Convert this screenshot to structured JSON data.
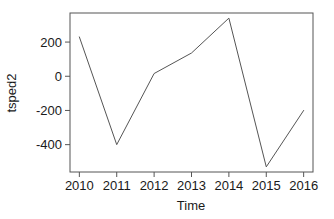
{
  "chart_data": {
    "type": "line",
    "title": "",
    "xlabel": "Time",
    "ylabel": "tsped2",
    "x": [
      2010,
      2011,
      2012,
      2013,
      2014,
      2015,
      2016
    ],
    "values": [
      230,
      -400,
      16,
      136,
      340,
      -530,
      -200
    ],
    "series": [
      {
        "name": "tsped2",
        "values": [
          230,
          -400,
          16,
          136,
          340,
          -530,
          -200
        ]
      }
    ],
    "xlim": [
      2009.75,
      2016.25
    ],
    "ylim": [
      -560,
      370
    ],
    "xticks": [
      2010,
      2011,
      2012,
      2013,
      2014,
      2015,
      2016
    ],
    "xtick_labels": [
      "2010",
      "2011",
      "2012",
      "2013",
      "2014",
      "2015",
      "2016"
    ],
    "yticks": [
      200,
      0,
      -200,
      -400
    ],
    "ytick_labels": [
      "200",
      "0",
      "-200",
      "-400"
    ],
    "grid": false,
    "legend": false,
    "line_color": "#555555",
    "axis_color": "#555555",
    "background": "#ffffff"
  },
  "axes": {
    "x_axis_label": "Time",
    "y_axis_label": "tsped2"
  }
}
